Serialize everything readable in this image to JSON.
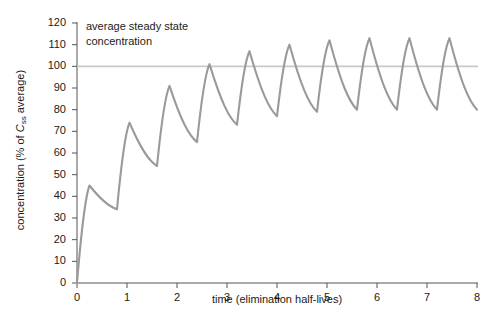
{
  "chart_data": {
    "type": "line",
    "title": "",
    "subtitle": "",
    "xlabel": "time (elimination half-lives)",
    "ylabel_parts": {
      "prefix": "concentration (% of ",
      "symbol": "C",
      "subscript": "ss",
      "suffix": " average)"
    },
    "ylabel": "concentration (% of Css average)",
    "xlim": [
      0,
      8
    ],
    "ylim": [
      0,
      120
    ],
    "xticks": [
      "0",
      "1",
      "2",
      "3",
      "4",
      "5",
      "6",
      "7",
      "8"
    ],
    "yticks": [
      "0",
      "10",
      "20",
      "30",
      "40",
      "50",
      "60",
      "70",
      "80",
      "90",
      "100",
      "110",
      "120"
    ],
    "grid": false,
    "legend_position": "none",
    "annotations": [
      {
        "name": "average-steady-state-concentration",
        "text": "average steady state\nconcentration",
        "x": 0.2,
        "y": 116
      }
    ],
    "reference_lines": [
      {
        "name": "average-steady-state-line",
        "orientation": "horizontal",
        "value": 100,
        "color": "#c9c9c9"
      }
    ],
    "series": [
      {
        "name": "plasma concentration",
        "color": "#9a9a9a",
        "dose_interval_half_lives": 0.8,
        "peaks": [
          {
            "x": 0.25,
            "y": 45
          },
          {
            "x": 1.05,
            "y": 74
          },
          {
            "x": 1.85,
            "y": 91
          },
          {
            "x": 2.65,
            "y": 101
          },
          {
            "x": 3.45,
            "y": 107
          },
          {
            "x": 4.25,
            "y": 110
          },
          {
            "x": 5.05,
            "y": 112
          },
          {
            "x": 5.85,
            "y": 113
          },
          {
            "x": 6.65,
            "y": 113
          },
          {
            "x": 7.45,
            "y": 113
          }
        ],
        "troughs": [
          {
            "x": 0.8,
            "y": 34
          },
          {
            "x": 1.6,
            "y": 54
          },
          {
            "x": 2.4,
            "y": 65
          },
          {
            "x": 3.2,
            "y": 73
          },
          {
            "x": 4.0,
            "y": 77
          },
          {
            "x": 4.8,
            "y": 79
          },
          {
            "x": 5.6,
            "y": 80
          },
          {
            "x": 6.4,
            "y": 80
          },
          {
            "x": 7.2,
            "y": 80
          },
          {
            "x": 8.0,
            "y": 80
          }
        ],
        "start_point": {
          "x": 0,
          "y": 0
        }
      }
    ]
  },
  "colors": {
    "curve": "#9a9a9a",
    "reference_line": "#c9c9c9",
    "axis": "#555555",
    "text": "#1a1a1a",
    "background": "#ffffff"
  }
}
